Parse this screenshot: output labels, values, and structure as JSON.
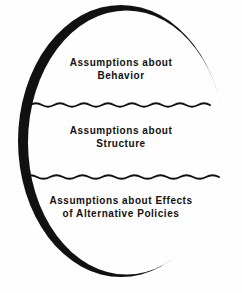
{
  "figure": {
    "shape": "oval",
    "background_color": "#fefefe",
    "stroke_color": "#111111",
    "text_color": "#111111",
    "divider_style": "wavy-line",
    "sections": [
      {
        "id": "behavior",
        "label": "Assumptions about\nBehavior",
        "line1": "Assumptions about",
        "line2": "Behavior"
      },
      {
        "id": "structure",
        "label": "Assumptions about\nStructure",
        "line1": "Assumptions about",
        "line2": "Structure"
      },
      {
        "id": "effects",
        "label": "Assumptions about Effects\nof Alternative Policies",
        "line1": "Assumptions about Effects",
        "line2": "of Alternative Policies"
      }
    ]
  }
}
